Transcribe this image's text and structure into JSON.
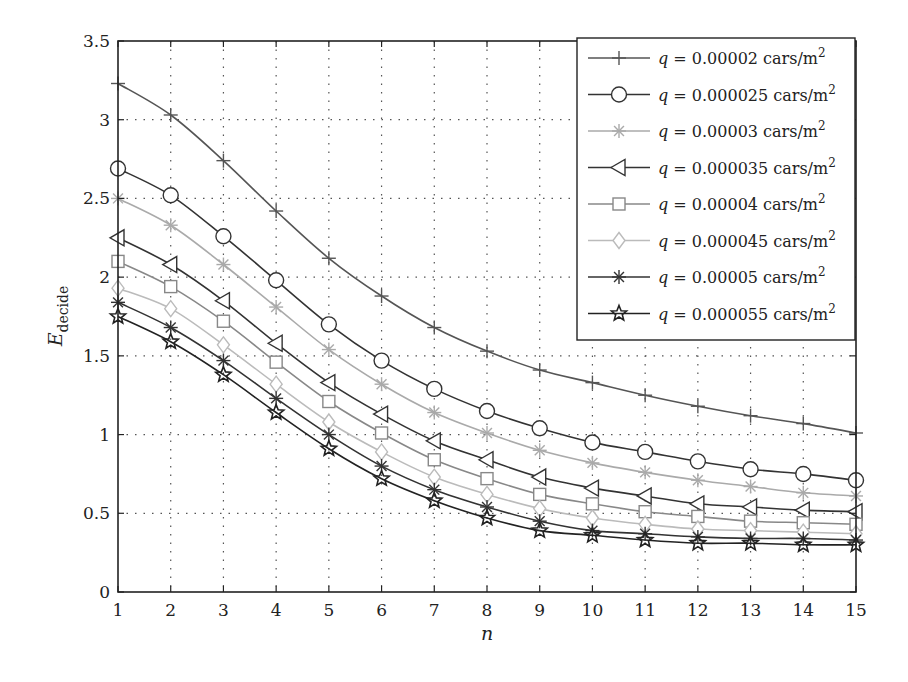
{
  "chart_data": {
    "type": "line",
    "title": "",
    "xlabel": "n",
    "ylabel": "E_decide",
    "ylabel_main": "E",
    "ylabel_sub": "decide",
    "x": [
      1,
      2,
      3,
      4,
      5,
      6,
      7,
      8,
      9,
      10,
      11,
      12,
      13,
      14,
      15
    ],
    "xlim": [
      1,
      15
    ],
    "ylim": [
      0,
      3.5
    ],
    "xticks": [
      "1",
      "2",
      "3",
      "4",
      "5",
      "6",
      "7",
      "8",
      "9",
      "10",
      "11",
      "12",
      "13",
      "14",
      "15"
    ],
    "yticks": [
      0,
      0.5,
      1,
      1.5,
      2,
      2.5,
      3,
      3.5
    ],
    "ytick_labels": [
      "0",
      "0.5",
      "1",
      "1.5",
      "2",
      "2.5",
      "3",
      "3.5"
    ],
    "grid": true,
    "legend_position": "upper right",
    "series": [
      {
        "name": "q = 0.00002 cars/m2",
        "q_text": "q",
        "value_text": " = 0.00002 cars/m",
        "sup": "2",
        "marker": "plus",
        "color": "#555555",
        "values": [
          3.23,
          3.03,
          2.74,
          2.42,
          2.12,
          1.88,
          1.68,
          1.53,
          1.41,
          1.33,
          1.25,
          1.18,
          1.12,
          1.07,
          1.01
        ]
      },
      {
        "name": "q = 0.000025 cars/m2",
        "q_text": "q",
        "value_text": " = 0.000025 cars/m",
        "sup": "2",
        "marker": "circle",
        "color": "#333333",
        "values": [
          2.69,
          2.52,
          2.26,
          1.98,
          1.7,
          1.47,
          1.29,
          1.15,
          1.04,
          0.95,
          0.89,
          0.83,
          0.78,
          0.75,
          0.71
        ]
      },
      {
        "name": "q = 0.00003 cars/m2",
        "q_text": "q",
        "value_text": " = 0.00003 cars/m",
        "sup": "2",
        "marker": "asterisk",
        "color": "#aaaaaa",
        "values": [
          2.5,
          2.33,
          2.08,
          1.81,
          1.54,
          1.32,
          1.14,
          1.01,
          0.9,
          0.82,
          0.76,
          0.71,
          0.67,
          0.63,
          0.61
        ]
      },
      {
        "name": "q = 0.000035 cars/m2",
        "q_text": "q",
        "value_text": " = 0.000035 cars/m",
        "sup": "2",
        "marker": "triangle-left",
        "color": "#333333",
        "values": [
          2.25,
          2.08,
          1.85,
          1.58,
          1.33,
          1.13,
          0.96,
          0.84,
          0.73,
          0.66,
          0.61,
          0.56,
          0.54,
          0.52,
          0.51
        ]
      },
      {
        "name": "q = 0.00004 cars/m2",
        "q_text": "q",
        "value_text": " = 0.00004 cars/m",
        "sup": "2",
        "marker": "square",
        "color": "#888888",
        "values": [
          2.1,
          1.94,
          1.72,
          1.46,
          1.21,
          1.01,
          0.84,
          0.72,
          0.62,
          0.56,
          0.51,
          0.48,
          0.45,
          0.44,
          0.43
        ]
      },
      {
        "name": "q = 0.000045 cars/m2",
        "q_text": "q",
        "value_text": " = 0.000045 cars/m",
        "sup": "2",
        "marker": "diamond",
        "color": "#bbbbbb",
        "values": [
          1.93,
          1.8,
          1.57,
          1.32,
          1.08,
          0.89,
          0.73,
          0.62,
          0.53,
          0.47,
          0.43,
          0.4,
          0.39,
          0.38,
          0.37
        ]
      },
      {
        "name": "q = 0.00005 cars/m2",
        "q_text": "q",
        "value_text": " = 0.00005 cars/m",
        "sup": "2",
        "marker": "asterisk",
        "color": "#333333",
        "values": [
          1.84,
          1.68,
          1.47,
          1.23,
          1.0,
          0.8,
          0.65,
          0.54,
          0.45,
          0.39,
          0.37,
          0.35,
          0.34,
          0.34,
          0.33
        ]
      },
      {
        "name": "q = 0.000055 cars/m2",
        "q_text": "q",
        "value_text": " = 0.000055 cars/m",
        "sup": "2",
        "marker": "star",
        "color": "#222222",
        "values": [
          1.75,
          1.59,
          1.38,
          1.14,
          0.91,
          0.72,
          0.58,
          0.47,
          0.39,
          0.36,
          0.33,
          0.31,
          0.31,
          0.3,
          0.3
        ]
      }
    ]
  }
}
